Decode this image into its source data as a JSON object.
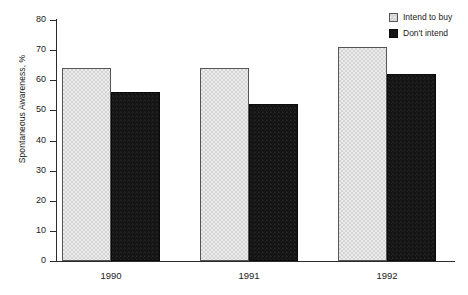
{
  "chart_data": {
    "type": "bar",
    "title": "",
    "subtitle": "",
    "xlabel": "",
    "ylabel": "Spontaneous Awareness, %",
    "categories": [
      "1990",
      "1991",
      "1992"
    ],
    "series": [
      {
        "name": "Intend to buy",
        "values": [
          64,
          64,
          71
        ],
        "color": "#d4d4d4"
      },
      {
        "name": "Don't intend",
        "values": [
          56,
          52,
          62
        ],
        "color": "#141414"
      }
    ],
    "ylim": [
      0,
      80
    ],
    "ytick_values": [
      80,
      70,
      60,
      50,
      40,
      30,
      20,
      10,
      0
    ],
    "ytick_labels": [
      "80",
      "70",
      "60",
      "50",
      "40",
      "30",
      "20",
      "10",
      "0"
    ],
    "grid": false,
    "legend_position": "top-right",
    "annotations": []
  },
  "axes": {
    "y_title": "Spontaneous Awareness, %"
  },
  "legend": {
    "entries": [
      {
        "label": "Intend to buy",
        "swatch": "light-gray-square"
      },
      {
        "label": "Don't intend",
        "swatch": "black-square"
      }
    ]
  }
}
